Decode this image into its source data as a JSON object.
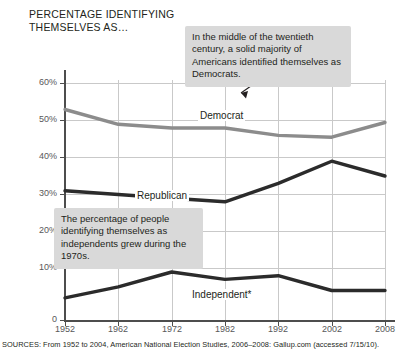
{
  "title": "PERCENTAGE IDENTIFYING THEMSELVES AS…",
  "source": "SOURCES: From 1952 to 2004, American National Election Studies, 2006–2008: Gallup.com (accessed 7/15/10).",
  "annotations": [
    {
      "name": "democrat-callout",
      "text": "In the middle of the twentieth century, a solid majority of Americans identified themselves as Democrats."
    },
    {
      "name": "independent-callout",
      "text": "The percentage of people identifying themselves as independents grew during the 1970s."
    }
  ],
  "colors": {
    "democrat": "#8c8c8c",
    "republican": "#2b2b2b",
    "independent": "#2b2b2b",
    "grid": "#c9c9c9",
    "axis": "#4d4d4d",
    "callout_bg": "#d9d9d9",
    "text": "#231f20"
  },
  "chart_data": {
    "type": "line",
    "title": "PERCENTAGE IDENTIFYING THEMSELVES AS…",
    "xlabel": "",
    "ylabel": "",
    "grid": true,
    "legend": "inline-labels",
    "categories": [
      "1952",
      "1962",
      "1972",
      "1982",
      "1992",
      "2002",
      "2008"
    ],
    "x": [
      1952,
      1962,
      1972,
      1982,
      1992,
      2002,
      2008
    ],
    "xlim": [
      1952,
      2008
    ],
    "ylim": [
      0,
      65
    ],
    "yticks": [
      0,
      10,
      20,
      30,
      40,
      50,
      60
    ],
    "ytick_labels": [
      "0",
      "10%",
      "20%",
      "30%",
      "40%",
      "50%",
      "60%"
    ],
    "series": [
      {
        "name": "Democrat",
        "label": "Democrat",
        "color": "#8c8c8c",
        "values": [
          57,
          53,
          52,
          52,
          50,
          49.5,
          53.5
        ]
      },
      {
        "name": "Republican",
        "label": "Republican",
        "color": "#2b2b2b",
        "values": [
          35,
          34,
          33,
          32,
          37,
          43,
          39
        ]
      },
      {
        "name": "Independent*",
        "label": "Independent*",
        "color": "#2b2b2b",
        "values": [
          6,
          9,
          13,
          11,
          12,
          8,
          8
        ]
      }
    ]
  }
}
